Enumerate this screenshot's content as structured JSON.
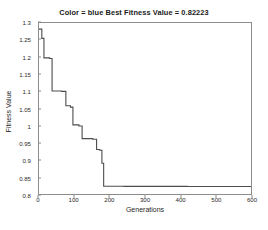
{
  "figure": {
    "background_color": "#ffffff",
    "axis_color": "#8c8c8c",
    "text_color": "#1f1f1f"
  },
  "chart_data": {
    "type": "line",
    "title": "Color = blue Best Fitness Value = 0.82223",
    "xlabel": "Generations",
    "ylabel": "Fitness Value",
    "xlim": [
      0,
      600
    ],
    "ylim": [
      0.8,
      1.3
    ],
    "xticks": [
      0,
      100,
      200,
      300,
      400,
      500,
      600
    ],
    "xtick_labels": [
      "0",
      "100",
      "200",
      "300",
      "400",
      "500",
      "600"
    ],
    "yticks": [
      0.8,
      0.85,
      0.9,
      0.95,
      1.0,
      1.05,
      1.1,
      1.15,
      1.2,
      1.25,
      1.3
    ],
    "ytick_labels": [
      "0.8",
      "0.85",
      "0.9",
      "0.95",
      "1",
      "1.05",
      "1.1",
      "1.15",
      "1.2",
      "1.25",
      "1.3"
    ],
    "grid": false,
    "legend": null,
    "series": [
      {
        "name": "Best fitness",
        "color": "#4d4d4d",
        "line_width": 1.1,
        "step": "post",
        "x": [
          0,
          8,
          8,
          14,
          14,
          30,
          30,
          37,
          37,
          64,
          64,
          76,
          76,
          89,
          89,
          96,
          96,
          113,
          113,
          122,
          122,
          152,
          152,
          163,
          163,
          172,
          172,
          178,
          178,
          183,
          183,
          240,
          240,
          420,
          420,
          600
        ],
        "y": [
          1.282,
          1.282,
          1.255,
          1.255,
          1.198,
          1.198,
          1.196,
          1.196,
          1.101,
          1.101,
          1.1,
          1.1,
          1.058,
          1.058,
          1.054,
          1.054,
          1.002,
          1.002,
          0.999,
          0.999,
          0.962,
          0.962,
          0.96,
          0.96,
          0.93,
          0.93,
          0.928,
          0.928,
          0.89,
          0.89,
          0.8225,
          0.8225,
          0.8222,
          0.8222,
          0.8221,
          0.8221
        ]
      }
    ],
    "annotations": {
      "best_fitness_value": "0.82223",
      "color_legend_text": "Color = blue"
    }
  }
}
